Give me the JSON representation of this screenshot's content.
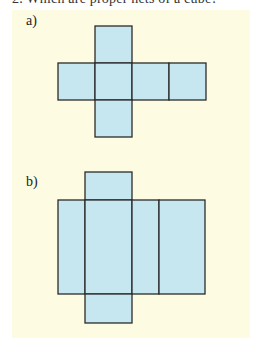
{
  "header": {
    "clipped_text": "2.   Which are proper nets of a cube?"
  },
  "colors": {
    "page_background": "#ffffff",
    "panel_background": "#fdfbe1",
    "face_fill": "#c6e6f0",
    "face_stroke": "#2b2b2b"
  },
  "figures": [
    {
      "label": "a)",
      "description": "Cross-shaped net of six equal squares: one square above and one below the second square of a row of four",
      "faces": [
        {
          "x": 95,
          "y": 26,
          "w": 37,
          "h": 37
        },
        {
          "x": 58,
          "y": 63,
          "w": 37,
          "h": 37
        },
        {
          "x": 95,
          "y": 63,
          "w": 37,
          "h": 37
        },
        {
          "x": 132,
          "y": 63,
          "w": 37,
          "h": 37
        },
        {
          "x": 169,
          "y": 63,
          "w": 37,
          "h": 37
        },
        {
          "x": 95,
          "y": 100,
          "w": 37,
          "h": 37
        }
      ]
    },
    {
      "label": "b)",
      "description": "Net of a rectangular prism: a row of four tall rectangles with a short tab above and below the second rectangle",
      "faces": [
        {
          "x": 85,
          "y": 172,
          "w": 47,
          "h": 28
        },
        {
          "x": 58,
          "y": 200,
          "w": 27,
          "h": 94
        },
        {
          "x": 85,
          "y": 200,
          "w": 47,
          "h": 94
        },
        {
          "x": 132,
          "y": 200,
          "w": 27,
          "h": 94
        },
        {
          "x": 159,
          "y": 200,
          "w": 46,
          "h": 94
        },
        {
          "x": 85,
          "y": 294,
          "w": 47,
          "h": 29
        }
      ]
    }
  ]
}
